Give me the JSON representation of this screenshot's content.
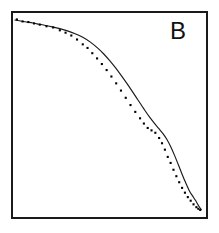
{
  "figure": {
    "panel_label": "B",
    "background_color": "#ffffff",
    "frame_color": "#1a1a1a",
    "curve_color": "#1a1a1a",
    "point_color": "#000000"
  },
  "chart_data": {
    "type": "scatter",
    "title": "B",
    "xlabel": "",
    "ylabel": "",
    "xlim": [
      0,
      100
    ],
    "ylim": [
      0,
      100
    ],
    "grid": false,
    "legend": false,
    "axis_ticks": false,
    "axis_tick_labels": [],
    "series": [
      {
        "name": "fitted-curve",
        "render": "line",
        "x": [
          0.5,
          4,
          8,
          12,
          16,
          20,
          24,
          28,
          32,
          36,
          40,
          44,
          47,
          50,
          53,
          56,
          59,
          62,
          65,
          68,
          71,
          74,
          76,
          78,
          80,
          82,
          84,
          86,
          88,
          90,
          92,
          93.5,
          95,
          96,
          97,
          98
        ],
        "y": [
          97.5,
          96.9,
          96.3,
          95.6,
          94.9,
          94.1,
          93.2,
          92.1,
          90.7,
          88.9,
          86.5,
          83.4,
          80.6,
          77.4,
          73.9,
          70.1,
          66.1,
          61.9,
          57.6,
          53.3,
          49.2,
          45.6,
          43.3,
          41.0,
          38.2,
          34.6,
          30.3,
          25.6,
          20.8,
          16.3,
          12.2,
          10.0,
          7.8,
          6.1,
          4.6,
          3.2
        ]
      },
      {
        "name": "data-points",
        "render": "markers",
        "x": [
          1.5,
          4.5,
          7.5,
          10.5,
          13.5,
          17,
          20.5,
          24,
          27,
          30,
          33,
          36,
          38.5,
          41,
          43.5,
          46,
          48.5,
          51,
          53.5,
          56,
          58.5,
          61,
          63.5,
          66,
          68,
          70,
          72,
          74,
          76,
          77.5,
          79,
          80.5,
          82,
          83.5,
          85,
          86.5,
          88,
          89.5,
          91,
          92.5,
          94,
          95.5,
          96.5,
          97.5
        ],
        "y": [
          97.8,
          96.8,
          96.5,
          95.8,
          95.2,
          94.4,
          93.8,
          92.4,
          91.2,
          89.8,
          87.8,
          85.4,
          83.6,
          81.0,
          78.4,
          75.6,
          72.6,
          69.4,
          66.0,
          62.4,
          58.8,
          55.2,
          51.8,
          48.6,
          46.0,
          43.8,
          42.6,
          41.4,
          38.8,
          36.2,
          33.0,
          29.4,
          26.4,
          23.0,
          19.8,
          16.8,
          14.0,
          11.6,
          9.4,
          7.6,
          5.8,
          4.4,
          3.6,
          3.0
        ]
      }
    ]
  }
}
